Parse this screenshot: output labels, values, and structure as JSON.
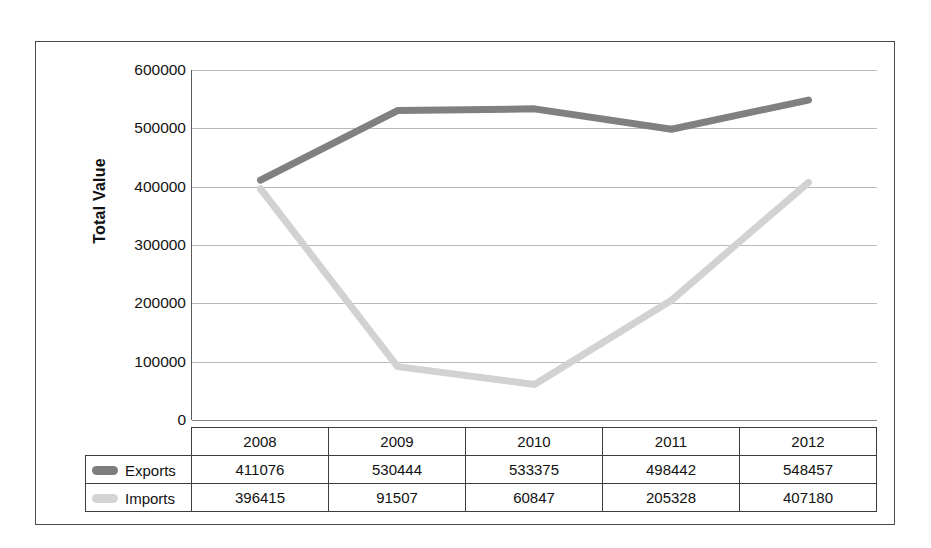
{
  "chart_data": {
    "type": "line",
    "title": "",
    "xlabel": "",
    "ylabel": "Total Value",
    "categories": [
      "2008",
      "2009",
      "2010",
      "2011",
      "2012"
    ],
    "series": [
      {
        "name": "Exports",
        "color": "#808080",
        "values": [
          411076,
          530444,
          533375,
          498442,
          548457
        ]
      },
      {
        "name": "Imports",
        "color": "#d2d2d2",
        "values": [
          396415,
          91507,
          60847,
          205328,
          407180
        ]
      }
    ],
    "ylim": [
      0,
      600000
    ],
    "ytick_values": [
      600000,
      500000,
      400000,
      300000,
      200000,
      100000,
      0
    ],
    "ytick_labels": [
      "600000",
      "500000",
      "400000",
      "300000",
      "200000",
      "100000",
      "0"
    ],
    "grid": true,
    "legend_position": "data-table-left",
    "has_data_table": true
  },
  "axis": {
    "y_title": "Total Value"
  },
  "table": {
    "year_headers": [
      "2008",
      "2009",
      "2010",
      "2011",
      "2012"
    ],
    "rows": [
      {
        "label": "Exports",
        "swatch_color": "#7d7d7d",
        "cells": [
          "411076",
          "530444",
          "533375",
          "498442",
          "548457"
        ]
      },
      {
        "label": "Imports",
        "swatch_color": "#d4d4d4",
        "cells": [
          "396415",
          "91507",
          "60847",
          "205328",
          "407180"
        ]
      }
    ]
  },
  "colors": {
    "exports_line": "#808080",
    "imports_line": "#d2d2d2",
    "gridline": "#b9b9b9",
    "frame_border": "#4a4a4a",
    "table_border": "#3c3c3c"
  }
}
